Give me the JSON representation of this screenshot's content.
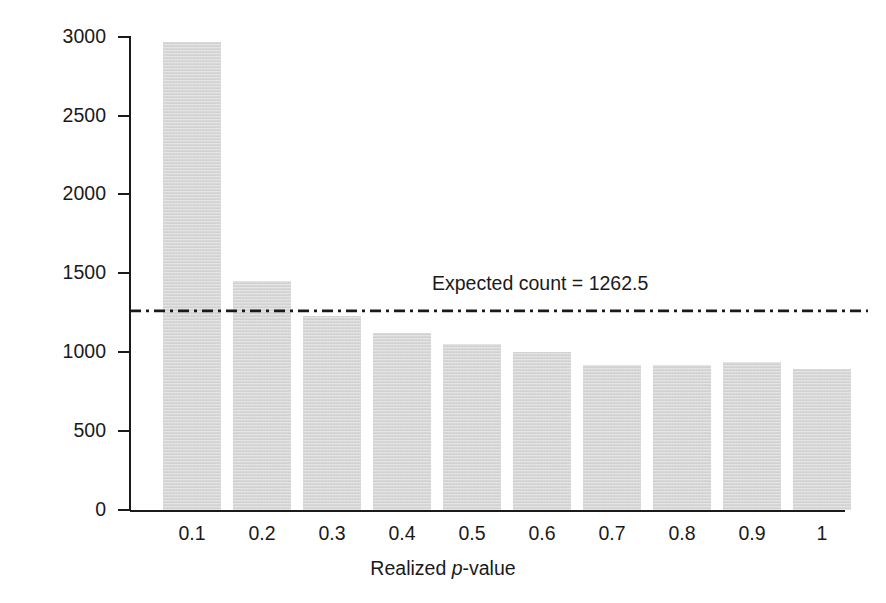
{
  "chart_data": {
    "type": "bar",
    "title": "",
    "subtitle": "",
    "xlabel_prefix": "Realized ",
    "xlabel_italic": "p",
    "xlabel_suffix": "-value",
    "xlabel": "Realized p-value",
    "ylabel": "Frequency",
    "categories": [
      "0.1",
      "0.2",
      "0.3",
      "0.4",
      "0.5",
      "0.6",
      "0.7",
      "0.8",
      "0.9",
      "1"
    ],
    "values": [
      2970,
      1455,
      1230,
      1125,
      1050,
      1000,
      920,
      920,
      940,
      895
    ],
    "ylim": [
      0,
      3000
    ],
    "yticks": [
      0,
      500,
      1000,
      1500,
      2000,
      2500,
      3000
    ],
    "ytick_labels": [
      "0",
      "500",
      "1000",
      "1500",
      "2000",
      "2500",
      "3000"
    ],
    "grid": false,
    "legend": "none",
    "bar_color": "#d9d9d9",
    "axis_color": "#1a1a1a",
    "annotations": [
      {
        "name": "expected-count",
        "label": "Expected count = 1262.5",
        "value": 1262.5,
        "line_style": "dash-dot",
        "line_color": "#1a1a1a"
      }
    ]
  },
  "axes": {
    "y_title": "Frequency",
    "x_title_prefix": "Realized ",
    "x_title_italic": "p",
    "x_title_suffix": "-value"
  },
  "annotation": {
    "expected_count_label": "Expected count = 1262.5"
  },
  "ytick_labels": {
    "t0": "0",
    "t1": "500",
    "t2": "1000",
    "t3": "1500",
    "t4": "2000",
    "t5": "2500",
    "t6": "3000"
  },
  "xtick_labels": {
    "c0": "0.1",
    "c1": "0.2",
    "c2": "0.3",
    "c3": "0.4",
    "c4": "0.5",
    "c5": "0.6",
    "c6": "0.7",
    "c7": "0.8",
    "c8": "0.9",
    "c9": "1"
  }
}
